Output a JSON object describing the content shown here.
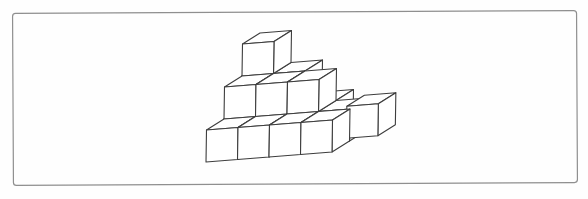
{
  "figure": {
    "type": "cube-stack-diagram",
    "canvas": {
      "width": 588,
      "height": 199,
      "background": "#fefefe"
    },
    "frame": {
      "x": 13,
      "y": 12,
      "width": 564,
      "height": 172,
      "stroke": "#8f8f8f",
      "stroke_width": 1.2,
      "corner_radius": 3,
      "rotation_deg": -0.3,
      "fill": "#fefefe"
    },
    "projection": {
      "origin": [
        206,
        162
      ],
      "x_axis": [
        31.5,
        -2.5
      ],
      "y_axis": [
        0.5,
        -32
      ],
      "z_axis": [
        17.5,
        -11
      ]
    },
    "style": {
      "line_color": "#3d3d3d",
      "line_width": 1.1,
      "face_fill": "#ffffff"
    },
    "cubes": [
      {
        "x": 0,
        "y": 0,
        "z": 2
      },
      {
        "x": 1,
        "y": 0,
        "z": 2
      },
      {
        "x": 2,
        "y": 0,
        "z": 2
      },
      {
        "x": 0,
        "y": 1,
        "z": 2
      },
      {
        "x": 1,
        "y": 1,
        "z": 2
      },
      {
        "x": 0,
        "y": 2,
        "z": 2
      },
      {
        "x": 0,
        "y": 0,
        "z": 1
      },
      {
        "x": 1,
        "y": 0,
        "z": 1
      },
      {
        "x": 2,
        "y": 0,
        "z": 1
      },
      {
        "x": 3,
        "y": 0,
        "z": 1
      },
      {
        "x": 3.9,
        "y": 0,
        "z": 1,
        "pixel_offset": [
          0,
          -3
        ],
        "detached": true
      },
      {
        "x": 0,
        "y": 1,
        "z": 1
      },
      {
        "x": 1,
        "y": 1,
        "z": 1
      },
      {
        "x": 2,
        "y": 1,
        "z": 1
      },
      {
        "x": 0,
        "y": 0,
        "z": 0
      },
      {
        "x": 1,
        "y": 0,
        "z": 0
      },
      {
        "x": 2,
        "y": 0,
        "z": 0
      },
      {
        "x": 3,
        "y": 0,
        "z": 0
      }
    ]
  }
}
